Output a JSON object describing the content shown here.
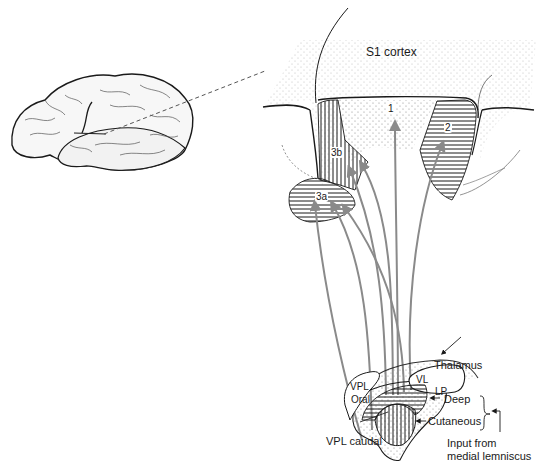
{
  "figure": {
    "title": "S1 cortex",
    "colors": {
      "outline": "#1a1a1a",
      "pathway": "#8a8a8a",
      "stipple": "#9a9a9a",
      "background": "#ffffff"
    }
  },
  "cortex": {
    "areas": [
      {
        "id": "3a",
        "label": "3a"
      },
      {
        "id": "3b",
        "label": "3b"
      },
      {
        "id": "1",
        "label": "1"
      },
      {
        "id": "2",
        "label": "2"
      }
    ]
  },
  "thalamus": {
    "label": "Thalamus",
    "nuclei": [
      {
        "id": "VL",
        "label": "VL"
      },
      {
        "id": "LP",
        "label": "LP"
      },
      {
        "id": "VPL_oral_1",
        "label": "VPL"
      },
      {
        "id": "VPL_oral_2",
        "label": "Oral"
      },
      {
        "id": "VPL_caudal",
        "label": "VPL caudal"
      }
    ],
    "layers": [
      {
        "id": "deep",
        "label": "Deep"
      },
      {
        "id": "cutaneous",
        "label": "Cutaneous"
      }
    ],
    "input": {
      "line1": "Input from",
      "line2": "medial lemniscus"
    }
  }
}
